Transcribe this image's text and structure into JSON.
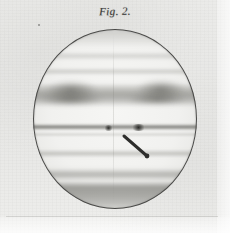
{
  "figure": {
    "caption": "Fig. 2.",
    "disk": {
      "outline_color": "#4a4a48",
      "fill_color": "#f3f3f1",
      "center_x": 115,
      "center_y": 119,
      "radius_x": 82,
      "radius_y": 90
    },
    "paper_color": "#e9e9e7",
    "ink_color": "#3a3a38",
    "belts": [
      {
        "name": "north-polar-region",
        "label": "N polar region",
        "top_pct": 0,
        "height_pct": 9,
        "darkness": 0.3
      },
      {
        "name": "north-north-temperate-belt",
        "label": "N N temperate belt",
        "top_pct": 13,
        "height_pct": 4.5,
        "darkness": 0.26
      },
      {
        "name": "north-temperate-belt",
        "label": "N temperate belt",
        "top_pct": 21.5,
        "height_pct": 4,
        "darkness": 0.3
      },
      {
        "name": "north-equatorial-belt",
        "label": "N equatorial belt",
        "top_pct": 31,
        "height_pct": 12,
        "darkness": 0.52
      },
      {
        "name": "equatorial-band",
        "label": "equatorial band",
        "top_pct": 53,
        "height_pct": 3.2,
        "darkness": 0.72
      },
      {
        "name": "south-temperate-belt",
        "label": "S temperate belt",
        "top_pct": 67,
        "height_pct": 4.2,
        "darkness": 0.4
      },
      {
        "name": "south-south-temperate-belt",
        "label": "S S temperate belt",
        "top_pct": 77.5,
        "height_pct": 6.5,
        "darkness": 0.5
      },
      {
        "name": "south-polar-region",
        "label": "S polar region",
        "top_pct": 86,
        "height_pct": 14,
        "darkness": 0.56
      }
    ],
    "spots": [
      {
        "name": "equatorial-condensation-left",
        "left_pct": 43,
        "top_pct": 53.2
      },
      {
        "name": "equatorial-condensation-right",
        "left_pct": 60,
        "top_pct": 53.0
      }
    ],
    "pointer": {
      "label": "ink pointer line",
      "x1": 124,
      "y1": 136,
      "x2": 147,
      "y2": 156,
      "color": "#2e2e2c",
      "width": 3,
      "tip_radius": 2.4
    },
    "marks": {
      "speck_label": "ink speck"
    }
  }
}
